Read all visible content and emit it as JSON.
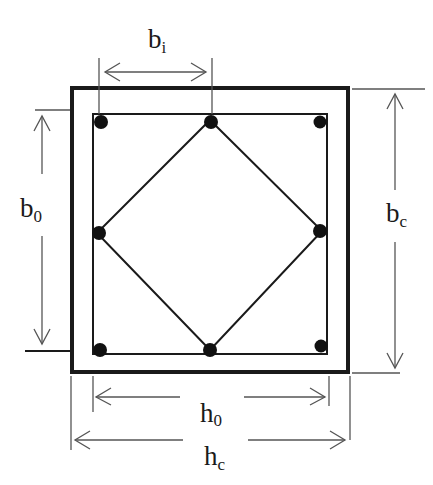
{
  "diagram": {
    "colors": {
      "ink": "#1a1a1a",
      "dimension": "#555555",
      "background": "#ffffff"
    },
    "labels": {
      "bi": {
        "base": "b",
        "sub": "i"
      },
      "b0": {
        "base": "b",
        "sub": "0"
      },
      "bc": {
        "base": "b",
        "sub": "c"
      },
      "h0": {
        "base": "h",
        "sub": "0"
      },
      "hc": {
        "base": "h",
        "sub": "c"
      }
    },
    "section": {
      "outer_box": {
        "x1": 72,
        "y1": 88,
        "x2": 348,
        "y2": 372
      },
      "hoop": {
        "x1": 93,
        "y1": 114,
        "x2": 327,
        "y2": 354
      },
      "diamond_tie": [
        [
          210,
          120
        ],
        [
          322,
          231
        ],
        [
          210,
          350
        ],
        [
          97,
          233
        ]
      ],
      "bars": [
        {
          "id": "top-left",
          "x": 101,
          "y": 122
        },
        {
          "id": "top-middle",
          "x": 211,
          "y": 122
        },
        {
          "id": "top-right",
          "x": 320,
          "y": 122
        },
        {
          "id": "middle-left",
          "x": 99,
          "y": 233
        },
        {
          "id": "middle-right",
          "x": 320,
          "y": 231
        },
        {
          "id": "bottom-left",
          "x": 100,
          "y": 350
        },
        {
          "id": "bottom-middle",
          "x": 210,
          "y": 350
        },
        {
          "id": "bottom-right",
          "x": 321,
          "y": 346
        }
      ],
      "bar_count": 8
    }
  }
}
